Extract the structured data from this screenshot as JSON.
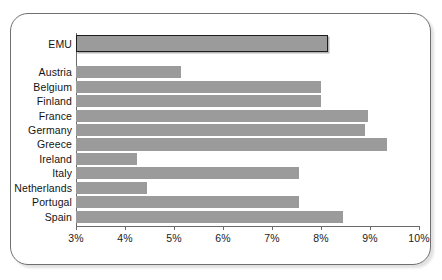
{
  "chart_data": {
    "type": "bar",
    "orientation": "horizontal",
    "title": "",
    "subtitle": "",
    "xlabel": "",
    "ylabel": "",
    "xlim": [
      3,
      10
    ],
    "xtick_values": [
      3,
      4,
      5,
      6,
      7,
      8,
      9,
      10
    ],
    "xtick_labels": [
      "3%",
      "4%",
      "5%",
      "6%",
      "7%",
      "8%",
      "9%",
      "10%"
    ],
    "grid": false,
    "legend": null,
    "bar_color": "#9b9b9b",
    "highlight_bar_edge_color": "#1d1d1d",
    "categories": [
      "EMU",
      "Austria",
      "Belgium",
      "Finland",
      "France",
      "Germany",
      "Greece",
      "Ireland",
      "Italy",
      "Netherlands",
      "Portugal",
      "Spain"
    ],
    "values": [
      8.15,
      5.15,
      8.0,
      8.0,
      8.95,
      8.9,
      9.35,
      4.25,
      7.55,
      4.45,
      7.55,
      8.45
    ],
    "bars": [
      {
        "label": "EMU",
        "value": 8.15,
        "highlight": true
      },
      {
        "label": "Austria",
        "value": 5.15,
        "highlight": false
      },
      {
        "label": "Belgium",
        "value": 8.0,
        "highlight": false
      },
      {
        "label": "Finland",
        "value": 8.0,
        "highlight": false
      },
      {
        "label": "France",
        "value": 8.95,
        "highlight": false
      },
      {
        "label": "Germany",
        "value": 8.9,
        "highlight": false
      },
      {
        "label": "Greece",
        "value": 9.35,
        "highlight": false
      },
      {
        "label": "Ireland",
        "value": 4.25,
        "highlight": false
      },
      {
        "label": "Italy",
        "value": 7.55,
        "highlight": false
      },
      {
        "label": "Netherlands",
        "value": 4.45,
        "highlight": false
      },
      {
        "label": "Portugal",
        "value": 7.55,
        "highlight": false
      },
      {
        "label": "Spain",
        "value": 8.45,
        "highlight": false
      }
    ]
  }
}
